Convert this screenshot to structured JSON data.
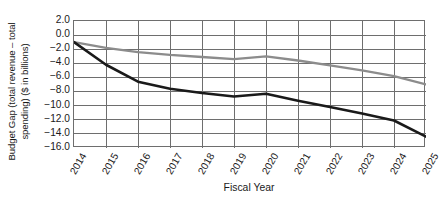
{
  "chart_data": {
    "type": "line",
    "title": "",
    "xlabel": "Fiscal Year",
    "ylabel": "Budget Gap (total revenue – total spending) ($ in billions)",
    "ylabel_line1": "Budget Gap (total revenue – total",
    "ylabel_line2": "spending) ($ in billions)",
    "categories": [
      "2014",
      "2015",
      "2016",
      "2017",
      "2018",
      "2019",
      "2020",
      "2021",
      "2022",
      "2023",
      "2024",
      "2025"
    ],
    "x": [
      2014,
      2015,
      2016,
      2017,
      2018,
      2019,
      2020,
      2021,
      2022,
      2023,
      2024,
      2025
    ],
    "ylim": [
      -16.0,
      2.0
    ],
    "xlim": [
      2014,
      2025
    ],
    "yticks": [
      2.0,
      0.0,
      -2.0,
      -4.0,
      -6.0,
      -8.0,
      -10.0,
      -12.0,
      -14.0,
      -16.0
    ],
    "ytick_labels": [
      "2.0",
      "0.0",
      "−2.0",
      "−4.0",
      "−6.0",
      "−8.0",
      "−10.0",
      "−12.0",
      "−14.0",
      "−16.0"
    ],
    "grid": true,
    "grid_axis": "both",
    "legend": false,
    "legend_position": "none",
    "series": [
      {
        "name": "black-line",
        "color": "#1a1a1a",
        "line_width": 2.6,
        "values": [
          -1.0,
          -4.2,
          -6.6,
          -7.6,
          -8.2,
          -8.7,
          -8.3,
          -9.3,
          -10.2,
          -11.1,
          -12.1,
          -14.4
        ]
      },
      {
        "name": "gray-line",
        "color": "#8c8c8c",
        "line_width": 2.3,
        "values": [
          -1.0,
          -1.8,
          -2.4,
          -2.8,
          -3.1,
          -3.4,
          -3.0,
          -3.6,
          -4.3,
          -5.0,
          -5.8,
          -7.0
        ]
      }
    ],
    "colors": {
      "series_black": "#1a1a1a",
      "series_gray": "#8c8c8c",
      "grid": "#6e6e6e",
      "axis": "#6e6e6e",
      "background": "#ffffff",
      "text": "#1a1a1a"
    }
  }
}
